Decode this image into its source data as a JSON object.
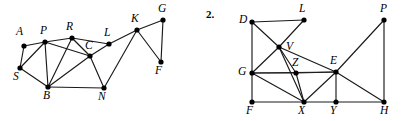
{
  "page": {
    "width": 401,
    "height": 121,
    "background": "#ffffff",
    "ink_color": "#1a1a1a"
  },
  "figure1": {
    "number_label": "",
    "vertices": [
      {
        "id": "A",
        "label": "A",
        "x": 24,
        "y": 46,
        "label_x": 16,
        "label_y": 26
      },
      {
        "id": "P",
        "label": "P",
        "x": 45,
        "y": 42,
        "label_x": 40,
        "label_y": 25
      },
      {
        "id": "S",
        "label": "S",
        "x": 20,
        "y": 68,
        "label_x": 13,
        "label_y": 71
      },
      {
        "id": "B",
        "label": "B",
        "x": 48,
        "y": 87,
        "label_x": 43,
        "label_y": 90
      },
      {
        "id": "R",
        "label": "R",
        "x": 72,
        "y": 38,
        "label_x": 66,
        "label_y": 21
      },
      {
        "id": "C",
        "label": "C",
        "x": 90,
        "y": 56,
        "label_x": 85,
        "label_y": 40
      },
      {
        "id": "L",
        "label": "L",
        "x": 109,
        "y": 44,
        "label_x": 104,
        "label_y": 27
      },
      {
        "id": "N",
        "label": "N",
        "x": 104,
        "y": 88,
        "label_x": 98,
        "label_y": 91
      },
      {
        "id": "K",
        "label": "K",
        "x": 137,
        "y": 30,
        "label_x": 131,
        "label_y": 13
      },
      {
        "id": "G",
        "label": "G",
        "x": 163,
        "y": 20,
        "label_x": 158,
        "label_y": 3
      },
      {
        "id": "F",
        "label": "F",
        "x": 161,
        "y": 62,
        "label_x": 155,
        "label_y": 65
      }
    ],
    "edges": [
      [
        "A",
        "P"
      ],
      [
        "A",
        "S"
      ],
      [
        "P",
        "S"
      ],
      [
        "P",
        "B"
      ],
      [
        "S",
        "B"
      ],
      [
        "P",
        "R"
      ],
      [
        "P",
        "C"
      ],
      [
        "R",
        "B"
      ],
      [
        "R",
        "C"
      ],
      [
        "R",
        "L"
      ],
      [
        "B",
        "C"
      ],
      [
        "B",
        "N"
      ],
      [
        "C",
        "N"
      ],
      [
        "C",
        "L"
      ],
      [
        "L",
        "K"
      ],
      [
        "N",
        "K"
      ],
      [
        "K",
        "G"
      ],
      [
        "K",
        "F"
      ],
      [
        "G",
        "F"
      ]
    ]
  },
  "figure2": {
    "number_label": "2.",
    "number_x": 6,
    "number_y": 8,
    "vertices": [
      {
        "id": "D",
        "label": "D",
        "x": 52,
        "y": 22,
        "label_x": 39,
        "label_y": 14
      },
      {
        "id": "L",
        "label": "L",
        "x": 104,
        "y": 20,
        "label_x": 99,
        "label_y": 3
      },
      {
        "id": "V",
        "label": "V",
        "x": 79,
        "y": 47,
        "label_x": 86,
        "label_y": 41
      },
      {
        "id": "Z",
        "label": "Z",
        "x": 96,
        "y": 73,
        "label_x": 92,
        "label_y": 57
      },
      {
        "id": "G",
        "label": "G",
        "x": 52,
        "y": 73,
        "label_x": 38,
        "label_y": 66
      },
      {
        "id": "E",
        "label": "E",
        "x": 136,
        "y": 72,
        "label_x": 130,
        "label_y": 55
      },
      {
        "id": "P",
        "label": "P",
        "x": 184,
        "y": 20,
        "label_x": 180,
        "label_y": 3
      },
      {
        "id": "F",
        "label": "F",
        "x": 52,
        "y": 102,
        "label_x": 46,
        "label_y": 105
      },
      {
        "id": "X",
        "label": "X",
        "x": 104,
        "y": 102,
        "label_x": 98,
        "label_y": 105
      },
      {
        "id": "Y",
        "label": "Y",
        "x": 136,
        "y": 102,
        "label_x": 130,
        "label_y": 105
      },
      {
        "id": "H",
        "label": "H",
        "x": 184,
        "y": 102,
        "label_x": 180,
        "label_y": 105
      }
    ],
    "edges": [
      [
        "D",
        "L"
      ],
      [
        "D",
        "V"
      ],
      [
        "D",
        "G"
      ],
      [
        "L",
        "V"
      ],
      [
        "V",
        "G"
      ],
      [
        "V",
        "Z"
      ],
      [
        "V",
        "E"
      ],
      [
        "V",
        "X"
      ],
      [
        "G",
        "Z"
      ],
      [
        "G",
        "E"
      ],
      [
        "G",
        "X"
      ],
      [
        "G",
        "F"
      ],
      [
        "Z",
        "E"
      ],
      [
        "Z",
        "X"
      ],
      [
        "E",
        "X"
      ],
      [
        "E",
        "Y"
      ],
      [
        "E",
        "H"
      ],
      [
        "E",
        "P"
      ],
      [
        "P",
        "H"
      ],
      [
        "F",
        "X"
      ],
      [
        "X",
        "Y"
      ],
      [
        "Y",
        "H"
      ]
    ]
  }
}
